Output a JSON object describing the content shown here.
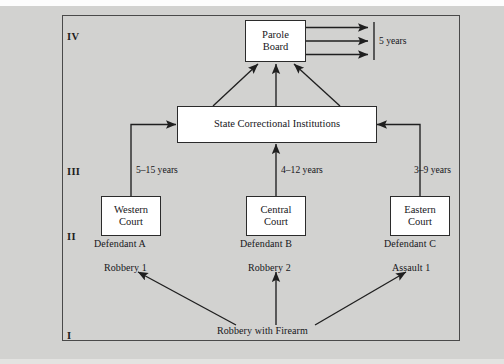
{
  "figure": {
    "type": "flow-diagram",
    "levels": [
      {
        "numeral": "IV",
        "name": "level-iv"
      },
      {
        "numeral": "III",
        "name": "level-iii"
      },
      {
        "numeral": "II",
        "name": "level-ii"
      },
      {
        "numeral": "I",
        "name": "level-i"
      }
    ],
    "nodes": {
      "parole_board": {
        "line1": "Parole",
        "line2": "Board"
      },
      "corrections": {
        "label": "State Correctional Institutions"
      },
      "western_court": {
        "line1": "Western",
        "line2": "Court"
      },
      "central_court": {
        "line1": "Central",
        "line2": "Court"
      },
      "eastern_court": {
        "line1": "Eastern",
        "line2": "Court"
      },
      "origin": {
        "label": "Robbery with Firearm"
      }
    },
    "defendants": [
      {
        "name": "Defendant A",
        "charge": "Robbery 1",
        "court": "Western Court",
        "sentence": "5–15 years"
      },
      {
        "name": "Defendant B",
        "charge": "Robbery 2",
        "court": "Central Court",
        "sentence": "4–12 years"
      },
      {
        "name": "Defendant C",
        "charge": "Assault 1",
        "court": "Eastern Court",
        "sentence": "3–9 years"
      }
    ],
    "parole_term": "5 years",
    "colors": {
      "page_background": "#d2d2d0",
      "box_fill": "#ffffff",
      "line": "#1f1f1f",
      "frame": "#4a4a4a"
    }
  }
}
